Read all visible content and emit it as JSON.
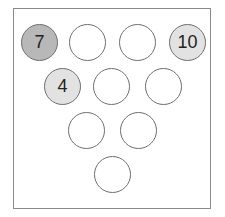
{
  "diagram": {
    "pins": [
      {
        "row": 1,
        "label": "7",
        "shade": "dark",
        "cx": 39,
        "cy": 42
      },
      {
        "row": 1,
        "label": "",
        "shade": "none",
        "cx": 87,
        "cy": 42
      },
      {
        "row": 1,
        "label": "",
        "shade": "none",
        "cx": 137,
        "cy": 42
      },
      {
        "row": 1,
        "label": "10",
        "shade": "light",
        "cx": 187,
        "cy": 42
      },
      {
        "row": 2,
        "label": "4",
        "shade": "light",
        "cx": 62,
        "cy": 86
      },
      {
        "row": 2,
        "label": "",
        "shade": "none",
        "cx": 111,
        "cy": 86
      },
      {
        "row": 2,
        "label": "",
        "shade": "none",
        "cx": 163,
        "cy": 86
      },
      {
        "row": 3,
        "label": "",
        "shade": "none",
        "cx": 86,
        "cy": 130
      },
      {
        "row": 3,
        "label": "",
        "shade": "none",
        "cx": 138,
        "cy": 130
      },
      {
        "row": 4,
        "label": "",
        "shade": "none",
        "cx": 112,
        "cy": 174
      }
    ],
    "colors": {
      "dark_fill": "#b8b8b8",
      "light_fill": "#e2e2e2",
      "empty_fill": "#ffffff",
      "stroke": "#6f6f6f"
    }
  }
}
